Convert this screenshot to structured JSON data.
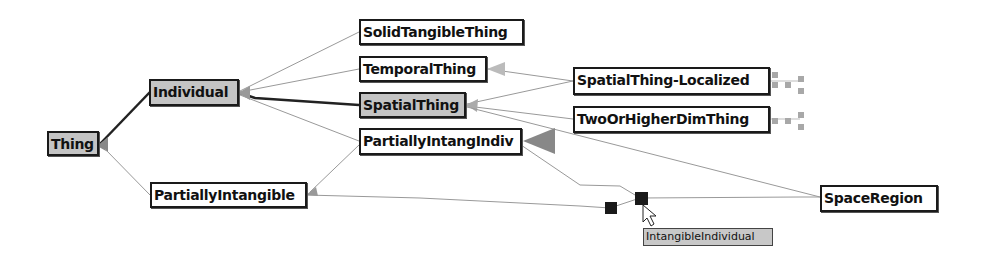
{
  "diagram": {
    "type": "ontology-graph",
    "nodes": [
      {
        "id": "thing",
        "label": "Thing",
        "selected": true
      },
      {
        "id": "individual",
        "label": "Individual",
        "selected": true
      },
      {
        "id": "partially_intangible",
        "label": "PartiallyIntangible",
        "selected": false
      },
      {
        "id": "solid_tangible_thing",
        "label": "SolidTangibleThing",
        "selected": false
      },
      {
        "id": "temporal_thing",
        "label": "TemporalThing",
        "selected": false
      },
      {
        "id": "spatial_thing",
        "label": "SpatialThing",
        "selected": true
      },
      {
        "id": "partially_intang_indiv",
        "label": "PartiallyIntangIndiv",
        "selected": false
      },
      {
        "id": "spatial_thing_localized",
        "label": "SpatialThing-Localized",
        "selected": false
      },
      {
        "id": "two_or_higher_dim_thing",
        "label": "TwoOrHigherDimThing",
        "selected": false
      },
      {
        "id": "space_region",
        "label": "SpaceRegion",
        "selected": false
      }
    ],
    "edges": [
      {
        "from": "individual",
        "to": "thing",
        "style": "thick"
      },
      {
        "from": "partially_intangible",
        "to": "thing",
        "style": "thin"
      },
      {
        "from": "solid_tangible_thing",
        "to": "individual",
        "style": "thin"
      },
      {
        "from": "temporal_thing",
        "to": "individual",
        "style": "thin"
      },
      {
        "from": "spatial_thing",
        "to": "individual",
        "style": "thick"
      },
      {
        "from": "partially_intang_indiv",
        "to": "individual",
        "style": "thin"
      },
      {
        "from": "partially_intang_indiv",
        "to": "partially_intangible",
        "style": "thin"
      },
      {
        "from": "spatial_thing_localized",
        "to": "temporal_thing",
        "style": "thin"
      },
      {
        "from": "spatial_thing_localized",
        "to": "spatial_thing",
        "style": "thin"
      },
      {
        "from": "two_or_higher_dim_thing",
        "to": "spatial_thing",
        "style": "thin"
      },
      {
        "from": "space_region",
        "to": "spatial_thing",
        "style": "thin"
      },
      {
        "from": "space_region",
        "to": "partially_intang_indiv",
        "style": "thin"
      }
    ],
    "hidden_node_markers": 2,
    "tooltip": {
      "text": "IntangibleIndividual"
    }
  }
}
